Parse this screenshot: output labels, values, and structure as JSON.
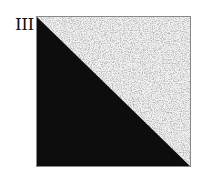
{
  "panel": {
    "label": "III",
    "lower_triangle_color": "#0d0d0d",
    "upper_triangle_texture": "speckled-noise",
    "upper_triangle_base_color": "#f2f2f2",
    "speckle_color": "#8a8a8a"
  }
}
